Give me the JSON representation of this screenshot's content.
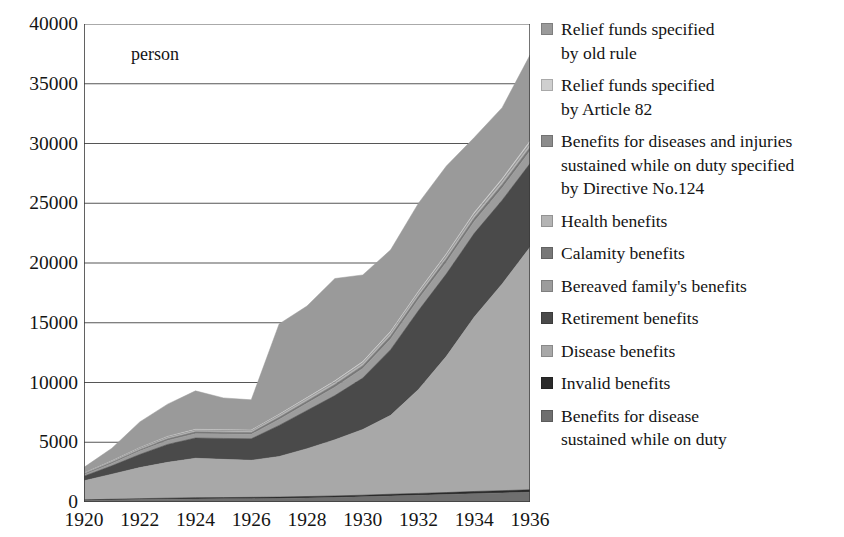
{
  "chart_data": {
    "type": "area",
    "stacked": true,
    "title": "",
    "subtitle": "",
    "xlabel": "",
    "ylabel": "person",
    "unit_label": "person",
    "grid": true,
    "legend_position": "right",
    "xlim": [
      1920,
      1936
    ],
    "ylim": [
      0,
      40000
    ],
    "ytick_values": [
      0,
      5000,
      10000,
      15000,
      20000,
      25000,
      30000,
      35000,
      40000
    ],
    "ytick_labels": [
      "0",
      "5000",
      "10000",
      "15000",
      "20000",
      "25000",
      "30000",
      "35000",
      "40000"
    ],
    "x": [
      1920,
      1921,
      1922,
      1923,
      1924,
      1925,
      1926,
      1927,
      1928,
      1929,
      1930,
      1931,
      1932,
      1933,
      1934,
      1935,
      1936
    ],
    "xtick_labels": [
      "1920",
      "1922",
      "1924",
      "1926",
      "1928",
      "1930",
      "1932",
      "1934",
      "1936"
    ],
    "xtick_label_values": [
      1920,
      1922,
      1924,
      1926,
      1928,
      1930,
      1932,
      1934,
      1936
    ],
    "xtick_all_values": [
      1920,
      1921,
      1922,
      1923,
      1924,
      1925,
      1926,
      1927,
      1928,
      1929,
      1930,
      1931,
      1932,
      1933,
      1934,
      1935,
      1936
    ],
    "series": [
      {
        "name": "Benefits for disease\nsustained while on duty",
        "color": "#6f6f6f",
        "values": [
          120,
          160,
          200,
          230,
          260,
          270,
          280,
          300,
          340,
          380,
          430,
          500,
          560,
          620,
          700,
          760,
          820
        ]
      },
      {
        "name": "Invalid benefits",
        "color": "#2b2b2b",
        "values": [
          60,
          70,
          80,
          90,
          100,
          100,
          110,
          110,
          120,
          130,
          140,
          150,
          160,
          170,
          180,
          190,
          200
        ]
      },
      {
        "name": "Disease benefits",
        "color": "#a8a8a8",
        "values": [
          1600,
          2100,
          2600,
          3000,
          3300,
          3200,
          3100,
          3400,
          4000,
          4700,
          5500,
          6600,
          8700,
          11400,
          14600,
          17300,
          20300
        ]
      },
      {
        "name": "Retirement benefits",
        "color": "#4a4a4a",
        "values": [
          380,
          700,
          1100,
          1500,
          1700,
          1750,
          1800,
          2600,
          3200,
          3700,
          4300,
          5500,
          6600,
          6900,
          7000,
          7000,
          7000
        ]
      },
      {
        "name": "Bereaved family's benefits",
        "color": "#9c9c9c",
        "values": [
          120,
          200,
          280,
          330,
          360,
          370,
          370,
          500,
          600,
          700,
          800,
          900,
          950,
          980,
          1000,
          1020,
          1050
        ]
      },
      {
        "name": "Calamity benefits",
        "color": "#787878",
        "values": [
          60,
          90,
          120,
          140,
          150,
          150,
          150,
          180,
          200,
          220,
          240,
          260,
          270,
          280,
          290,
          300,
          310
        ]
      },
      {
        "name": "Health benefits",
        "color": "#b4b4b4",
        "values": [
          40,
          60,
          80,
          90,
          100,
          100,
          100,
          120,
          130,
          140,
          150,
          160,
          170,
          180,
          190,
          200,
          210
        ]
      },
      {
        "name": "Benefits for diseases and injuries\nsustained while on duty specified\nby Directive No.124",
        "color": "#8c8c8c",
        "values": [
          30,
          40,
          50,
          60,
          60,
          60,
          60,
          70,
          80,
          90,
          100,
          110,
          120,
          130,
          140,
          150,
          160
        ]
      },
      {
        "name": "Relief funds specified\nby Article 82",
        "color": "#cfcfcf",
        "values": [
          20,
          30,
          40,
          50,
          50,
          50,
          50,
          60,
          70,
          80,
          90,
          100,
          110,
          120,
          130,
          140,
          150
        ]
      },
      {
        "name": "Relief funds specified\nby old rule",
        "color": "#9a9a9a",
        "values": [
          470,
          1050,
          2150,
          2700,
          3220,
          2660,
          2530,
          7560,
          7660,
          8560,
          7250,
          6820,
          7370,
          7340,
          6270,
          5940,
          7200
        ]
      }
    ],
    "totals": [
      2900,
      4500,
      6700,
      8190,
      9300,
      8710,
      8500,
      14900,
      16400,
      18700,
      19000,
      21100,
      25010,
      28120,
      30500,
      33000,
      37400
    ]
  },
  "legend": {
    "entries": [
      {
        "label": "Relief funds specified\nby old rule",
        "color": "#9a9a9a"
      },
      {
        "label": "Relief funds specified\nby Article 82",
        "color": "#cfcfcf"
      },
      {
        "label": "Benefits for diseases and injuries\nsustained while on duty specified\nby Directive No.124",
        "color": "#8c8c8c"
      },
      {
        "label": "Health benefits",
        "color": "#b4b4b4"
      },
      {
        "label": "Calamity benefits",
        "color": "#787878"
      },
      {
        "label": "Bereaved family's benefits",
        "color": "#9c9c9c"
      },
      {
        "label": "Retirement benefits",
        "color": "#4a4a4a"
      },
      {
        "label": "Disease benefits",
        "color": "#a8a8a8"
      },
      {
        "label": "Invalid benefits",
        "color": "#2b2b2b"
      },
      {
        "label": "Benefits for disease\nsustained while on duty",
        "color": "#6f6f6f"
      }
    ]
  }
}
